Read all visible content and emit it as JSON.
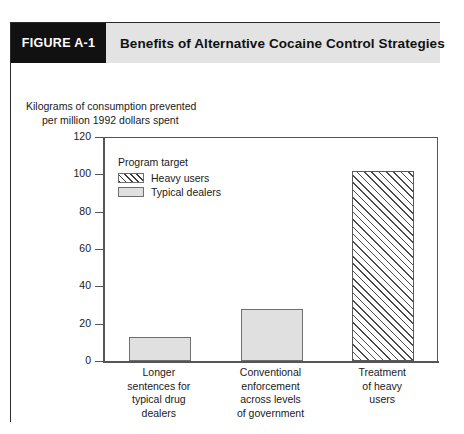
{
  "figure": {
    "tag": "FIGURE A-1",
    "title": "Benefits of Alternative Cocaine Control Strategies"
  },
  "axis_caption": {
    "line1": "Kilograms of consumption prevented",
    "line2": "per million 1992 dollars spent"
  },
  "legend": {
    "title": "Program target",
    "items": [
      {
        "label": "Heavy users",
        "pattern": "hatched"
      },
      {
        "label": "Typical dealers",
        "pattern": "solid-gray"
      }
    ]
  },
  "chart_data": {
    "type": "bar",
    "title": "Benefits of Alternative Cocaine Control Strategies",
    "xlabel": "",
    "ylabel": "Kilograms of consumption prevented per million 1992 dollars spent",
    "ylim": [
      0,
      120
    ],
    "yticks": [
      0,
      20,
      40,
      60,
      80,
      100,
      120
    ],
    "grid": false,
    "legend_position": "inside-top-left",
    "categories": [
      "Longer sentences for typical drug dealers",
      "Conventional enforcement across levels of government",
      "Treatment of heavy users"
    ],
    "category_lines": [
      [
        "Longer",
        "sentences for",
        "typical drug",
        "dealers"
      ],
      [
        "Conventional",
        "enforcement",
        "across levels",
        "of government"
      ],
      [
        "Treatment",
        "of heavy",
        "users"
      ]
    ],
    "values": [
      13,
      28,
      102
    ],
    "bar_groups": [
      "Typical dealers",
      "Typical dealers",
      "Heavy users"
    ],
    "colors": {
      "typical_dealers": "#e0e0e0",
      "heavy_users_hatch": "#4a4a4a",
      "axis": "#555555",
      "header_band": "#e3e3e3",
      "tag_background": "#111111"
    }
  }
}
